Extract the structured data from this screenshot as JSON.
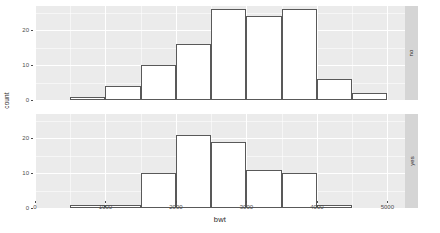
{
  "chart_data": {
    "type": "bar",
    "subtype": "histogram-faceted",
    "title": "",
    "xlabel": "bwt",
    "ylabel": "count",
    "xlim": [
      0,
      5250
    ],
    "ylim": [
      0,
      27
    ],
    "xticks": [
      0,
      1000,
      2000,
      3000,
      4000,
      5000
    ],
    "xtick_labels": [
      "0",
      "1000",
      "2000",
      "3000",
      "4000",
      "5000"
    ],
    "yticks": [
      0,
      10,
      20
    ],
    "ytick_labels": [
      "0",
      "10",
      "20"
    ],
    "grid": true,
    "grid_major_color": "#ffffff",
    "panel_background": "#ebebeb",
    "bar_fill": "#ffffff",
    "bar_outline": "#595959",
    "strip_background": "#d5d5d5",
    "bin_width": 500,
    "bin_edges": [
      500,
      1000,
      1500,
      2000,
      2500,
      3000,
      3500,
      4000,
      4500,
      5000
    ],
    "facet_variable": "smoke",
    "facet_position": "right",
    "panels": [
      {
        "strip_label": "no",
        "bin_starts": [
          500,
          1000,
          1500,
          2000,
          2500,
          3000,
          3500,
          4000,
          4500
        ],
        "values": [
          1,
          4,
          10,
          16,
          26,
          24,
          26,
          6,
          2
        ]
      },
      {
        "strip_label": "yes",
        "bin_starts": [
          500,
          1000,
          1500,
          2000,
          2500,
          3000,
          3500,
          4000,
          4500
        ],
        "values": [
          1,
          1,
          10,
          21,
          19,
          11,
          10,
          1,
          0
        ]
      }
    ]
  }
}
